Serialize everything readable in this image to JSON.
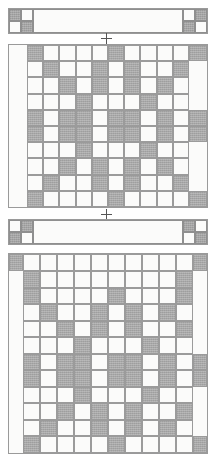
{
  "document": {
    "kind": "quilt-construction-diagram",
    "title": "Quilt block and sashing assembly diagram",
    "unit_count": 6,
    "colors": {
      "light_fabric": "#fbfbfa",
      "dark_fabric": "#a8a8a8",
      "seam_line": "#9a9a9a",
      "marker": "#555555",
      "page_background": "#ffffff"
    }
  },
  "markers": [
    {
      "name": "join-marker-top",
      "glyph": "+",
      "x": 100,
      "y": 32
    },
    {
      "name": "join-marker-middle",
      "glyph": "+",
      "x": 100,
      "y": 210
    }
  ],
  "units": [
    {
      "name": "sashing-strip-top",
      "type": "sashing-strip",
      "x": 8,
      "y": 8,
      "width": 200,
      "height": 26,
      "corner_style": "four-patch",
      "corners": {
        "top_left": [
          [
            "dark",
            "light"
          ],
          [
            "light",
            "dark"
          ]
        ],
        "top_right": [
          [
            "light",
            "dark"
          ],
          [
            "dark",
            "light"
          ]
        ],
        "bottom_left": null,
        "bottom_right": null
      },
      "center_fill": "light"
    },
    {
      "name": "quilt-block-upper",
      "type": "quilt-block",
      "x": 8,
      "y": 44,
      "width": 200,
      "height": 164,
      "grid_cols": 12,
      "grid_rows": 10,
      "side_border": "light",
      "pattern": [
        [
          "L",
          "D",
          "L",
          "L",
          "L",
          "L",
          "D",
          "L",
          "L",
          "L",
          "L",
          "D"
        ],
        [
          "L",
          "L",
          "D",
          "L",
          "L",
          "D",
          "L",
          "D",
          "L",
          "L",
          "D",
          "L"
        ],
        [
          "L",
          "L",
          "L",
          "D",
          "L",
          "D",
          "L",
          "D",
          "L",
          "D",
          "L",
          "L"
        ],
        [
          "L",
          "L",
          "L",
          "L",
          "D",
          "L",
          "L",
          "L",
          "D",
          "L",
          "L",
          "L"
        ],
        [
          "L",
          "D",
          "L",
          "D",
          "D",
          "L",
          "D",
          "D",
          "L",
          "D",
          "L",
          "D"
        ],
        [
          "L",
          "D",
          "L",
          "D",
          "D",
          "L",
          "D",
          "D",
          "L",
          "D",
          "L",
          "D"
        ],
        [
          "L",
          "L",
          "L",
          "L",
          "D",
          "L",
          "L",
          "L",
          "D",
          "L",
          "L",
          "L"
        ],
        [
          "L",
          "L",
          "L",
          "D",
          "L",
          "D",
          "L",
          "D",
          "L",
          "D",
          "L",
          "L"
        ],
        [
          "L",
          "L",
          "D",
          "L",
          "L",
          "D",
          "L",
          "D",
          "L",
          "L",
          "D",
          "L"
        ],
        [
          "L",
          "D",
          "L",
          "L",
          "L",
          "L",
          "D",
          "L",
          "L",
          "L",
          "L",
          "D"
        ]
      ]
    },
    {
      "name": "sashing-strip-middle",
      "type": "sashing-strip",
      "x": 8,
      "y": 215,
      "width": 200,
      "height": 26,
      "corner_style": "four-patch",
      "corners": {
        "top_left": [
          [
            "light",
            "dark"
          ],
          [
            "dark",
            "light"
          ]
        ],
        "top_right": [
          [
            "dark",
            "light"
          ],
          [
            "light",
            "dark"
          ]
        ],
        "bottom_left": null,
        "bottom_right": null
      },
      "center_fill": "light"
    },
    {
      "name": "quilt-block-lower",
      "type": "quilt-block",
      "x": 8,
      "y": 252,
      "width": 200,
      "height": 202,
      "grid_cols": 12,
      "grid_rows": 12,
      "side_border": "light",
      "has_top_border_row": true,
      "has_bottom_border_row": true,
      "pattern": [
        [
          "D",
          "L",
          "L",
          "L",
          "L",
          "L",
          "L",
          "L",
          "L",
          "L",
          "L",
          "D"
        ],
        [
          "L",
          "D",
          "L",
          "L",
          "L",
          "L",
          "L",
          "L",
          "L",
          "L",
          "D",
          "L"
        ],
        [
          "L",
          "D",
          "L",
          "L",
          "L",
          "L",
          "D",
          "L",
          "L",
          "L",
          "D",
          "L"
        ],
        [
          "L",
          "L",
          "D",
          "L",
          "L",
          "D",
          "L",
          "D",
          "L",
          "D",
          "L",
          "L"
        ],
        [
          "L",
          "L",
          "L",
          "D",
          "L",
          "D",
          "L",
          "D",
          "L",
          "L",
          "D",
          "L"
        ],
        [
          "L",
          "L",
          "L",
          "L",
          "D",
          "L",
          "L",
          "L",
          "D",
          "L",
          "L",
          "L"
        ],
        [
          "L",
          "D",
          "L",
          "D",
          "D",
          "L",
          "D",
          "D",
          "L",
          "D",
          "L",
          "D"
        ],
        [
          "L",
          "D",
          "L",
          "D",
          "D",
          "L",
          "D",
          "D",
          "L",
          "D",
          "L",
          "D"
        ],
        [
          "L",
          "L",
          "L",
          "L",
          "D",
          "L",
          "L",
          "L",
          "D",
          "L",
          "L",
          "L"
        ],
        [
          "L",
          "L",
          "L",
          "D",
          "L",
          "D",
          "L",
          "D",
          "L",
          "L",
          "D",
          "L"
        ],
        [
          "L",
          "L",
          "D",
          "L",
          "L",
          "D",
          "L",
          "D",
          "L",
          "D",
          "L",
          "L"
        ],
        [
          "L",
          "D",
          "L",
          "L",
          "L",
          "L",
          "D",
          "L",
          "L",
          "L",
          "L",
          "D"
        ]
      ]
    }
  ]
}
